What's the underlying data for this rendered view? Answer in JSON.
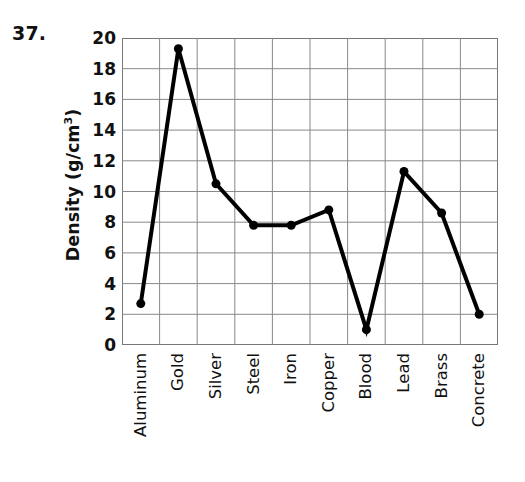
{
  "problem": {
    "number": "37."
  },
  "chart_data": {
    "type": "line",
    "title": "",
    "subtitle": "",
    "xlabel": "",
    "ylabel": "Density (g/cm",
    "ylabel_superscript": "3",
    "ylabel_suffix": ")",
    "ylabel_full": "Density (g/cm3)",
    "categories": [
      "Aluminum",
      "Gold",
      "Silver",
      "Steel",
      "Iron",
      "Copper",
      "Blood",
      "Lead",
      "Brass",
      "Concrete"
    ],
    "values": [
      2.7,
      19.3,
      10.5,
      7.8,
      7.8,
      8.8,
      1.0,
      11.3,
      8.6,
      2.0
    ],
    "ylim": [
      0,
      20
    ],
    "ytick_step": 2,
    "yticks": [
      "20",
      "18",
      "16",
      "14",
      "12",
      "10",
      "8",
      "6",
      "4",
      "2",
      "0"
    ],
    "ytick_values": [
      20,
      18,
      16,
      14,
      12,
      10,
      8,
      6,
      4,
      2,
      0
    ],
    "grid": true,
    "legend": false,
    "legend_position": "none",
    "series_color": "#000000",
    "grid_color": "#888888",
    "axis_color": "#777777",
    "marker": "circle",
    "marker_size": 9,
    "line_width": 4
  }
}
